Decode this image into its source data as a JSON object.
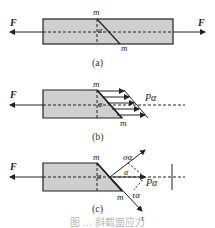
{
  "figure": {
    "panels": [
      {
        "id": "a",
        "caption": "(a)",
        "force_left": "F",
        "force_right": "F",
        "section_top": "m",
        "section_bottom": "m",
        "angle": "α"
      },
      {
        "id": "b",
        "caption": "(b)",
        "force_left": "F",
        "section_top": "m",
        "section_bottom": "m",
        "angle": "α",
        "resultant": "Pα"
      },
      {
        "id": "c",
        "caption": "(c)",
        "force_left": "F",
        "section_top": "m",
        "section_bottom": "m",
        "angle": "α",
        "angle2": "α",
        "normal_stress": "σα",
        "shear_stress": "τα",
        "tau_axis": "τ",
        "sigma_axis": "σ",
        "resultant": "Pα"
      }
    ],
    "caption": "图 … 斜截面应力"
  },
  "colors": {
    "fill": "#cfcfcf",
    "stroke": "#222222"
  }
}
